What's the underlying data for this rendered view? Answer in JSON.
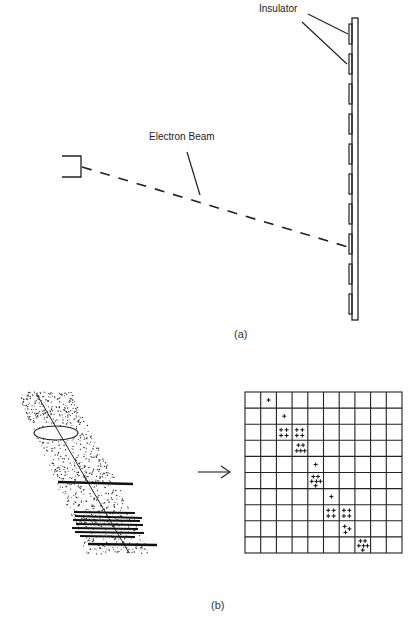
{
  "panel_a": {
    "caption": "(a)",
    "labels": {
      "insulator": "Insulator",
      "electron_beam": "Electron Beam"
    },
    "insulator_tab_count": 10
  },
  "panel_b": {
    "caption": "(b)",
    "grid": {
      "rows": 10,
      "cols": 10,
      "marks": [
        {
          "row": 0,
          "col": 1,
          "count": 1
        },
        {
          "row": 1,
          "col": 2,
          "count": 1
        },
        {
          "row": 2,
          "col": 2,
          "count": 4
        },
        {
          "row": 2,
          "col": 3,
          "count": 4
        },
        {
          "row": 3,
          "col": 3,
          "count": 5
        },
        {
          "row": 4,
          "col": 4,
          "count": 1
        },
        {
          "row": 5,
          "col": 4,
          "count": 6
        },
        {
          "row": 6,
          "col": 5,
          "count": 1
        },
        {
          "row": 7,
          "col": 5,
          "count": 4
        },
        {
          "row": 7,
          "col": 6,
          "count": 4
        },
        {
          "row": 8,
          "col": 6,
          "count": 3
        },
        {
          "row": 9,
          "col": 7,
          "count": 6
        }
      ],
      "mark_symbol": "+"
    },
    "arrow": "→"
  }
}
